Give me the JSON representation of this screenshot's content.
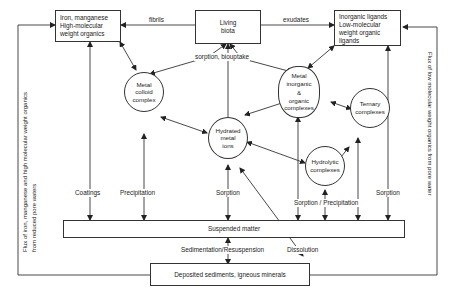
{
  "diagram": {
    "boxes": {
      "iron_manganese": {
        "line1": "Iron, manganese",
        "line2": "High-molecular",
        "line3": "weight organics"
      },
      "living_biota": {
        "line1": "Living",
        "line2": "biota"
      },
      "inorganic_ligands": {
        "line1": "Inorganic ligands",
        "line2": "Low-molecular",
        "line3": "weight organic",
        "line4": "ligands"
      },
      "suspended_matter": {
        "label": "Suspended matter"
      },
      "deposited_sediments": {
        "label": "Deposited sediments, igneous minerals"
      }
    },
    "nodes": {
      "metal_colloid": {
        "line1": "Metal",
        "line2": "colloid",
        "line3": "complex"
      },
      "metal_inorganic": {
        "line1": "Metal",
        "line2": "inorganic",
        "line3": "&",
        "line4": "organic",
        "line5": "complexes"
      },
      "hydrated_metal": {
        "line1": "Hydrated",
        "line2": "metal",
        "line3": "ions"
      },
      "ternary": {
        "line1": "Ternary",
        "line2": "complexes"
      },
      "hydrolytic": {
        "line1": "Hydrolytic",
        "line2": "complexes"
      }
    },
    "edge_labels": {
      "fibrils": "fibrils",
      "exudates": "exudates",
      "sorption_biouptake": "sorption,   biouptake",
      "coatings": "Coatings",
      "precipitation": "Precipitation",
      "sorption_center": "Sorption",
      "sorption_precipitation": "Sorption / Precipitation",
      "sorption_right": "Sorption",
      "sedimentation": "Sedimentation/Resuspension",
      "dissolution": "Dissolution"
    },
    "side_labels": {
      "left_line1": "Flux of  iron, manganese and high molecular weight organics",
      "left_line2": "from reduced pore waters",
      "right": "Flux of low molecular weight organics from pore water"
    },
    "colors": {
      "line": "#333333",
      "background": "#ffffff",
      "text": "#222222"
    }
  }
}
